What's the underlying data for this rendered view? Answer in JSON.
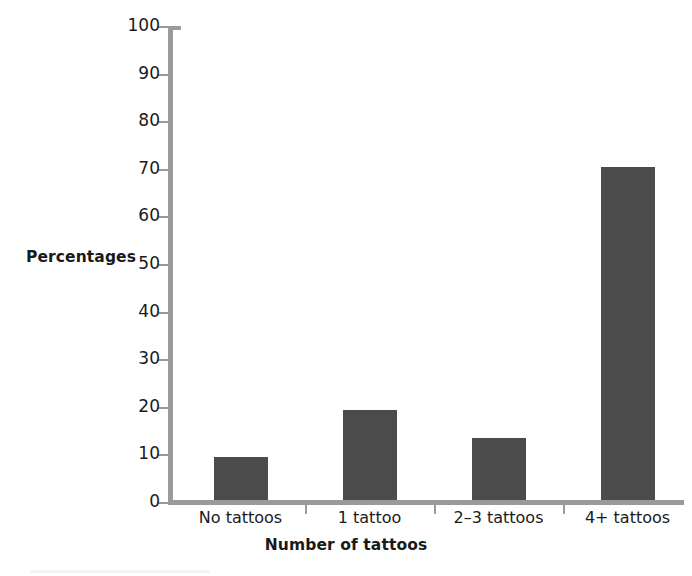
{
  "chart_data": {
    "type": "bar",
    "title": "",
    "subtitle": "",
    "categories": [
      "No tattoos",
      "1 tattoo",
      "2–3 tattoos",
      "4+ tattoos"
    ],
    "values": [
      9,
      19,
      13,
      70
    ],
    "xlabel": "Number of tattoos",
    "ylabel": "Percentages",
    "ylim": [
      0,
      100
    ],
    "ytick_step": 10,
    "yticks": [
      0,
      10,
      20,
      30,
      40,
      50,
      60,
      70,
      80,
      90,
      100
    ],
    "ytick_labels": [
      "0",
      "10",
      "20",
      "30",
      "40",
      "50",
      "60",
      "70",
      "80",
      "90",
      "100"
    ],
    "grid": false,
    "legend": null,
    "legend_position": "none",
    "annotations": [],
    "colors": {
      "bar_fill": "#4b4b4b",
      "axis_line": "#9a9a9a",
      "text": "#1a1a1a",
      "background": "#ffffff"
    }
  }
}
